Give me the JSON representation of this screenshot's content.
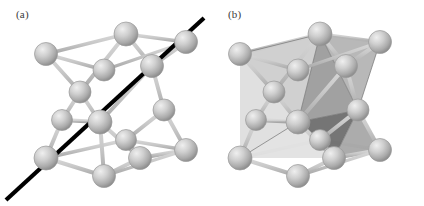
{
  "figure": {
    "background_color": "#ffffff",
    "width": 424,
    "height": 206,
    "caption_style": "two-panel crystal lattice illustration"
  },
  "panels": [
    {
      "id": "a",
      "label": "(a)",
      "description": "Diamond cubic unit cell with a black body-diagonal line passing through the cell",
      "has_diagonal_line": true,
      "has_shaded_tetrahedra": false
    },
    {
      "id": "b",
      "label": "(b)",
      "description": "Diamond cubic unit cell with two shaded interpenetrating tetrahedra highlighted",
      "has_diagonal_line": false,
      "has_shaded_tetrahedra": true
    }
  ],
  "colors": {
    "atom_light": "#e8e8e8",
    "atom_mid": "#b6b6b6",
    "atom_dark": "#8e8e8e",
    "atom_outline": "#9a9a9a",
    "bond": "#c6c6c6",
    "bond_shade": "#a9a9a9",
    "cell_edge": "#c2c2c2",
    "diagonal_line": "#000000",
    "facet_darkest": "#6e6e6e",
    "facet_dark": "#8a8a8a",
    "facet_mid": "#a8a8a8",
    "facet_light": "#c6c6c6",
    "facet_lightest": "#e2e2e2",
    "label_text": "#3a3a3a",
    "background": "#ffffff"
  },
  "structure": {
    "lattice_type": "diamond cubic",
    "atom_count_drawn": 18,
    "cell_corners_visible": 8,
    "diagonal_direction": "body diagonal [111]"
  }
}
